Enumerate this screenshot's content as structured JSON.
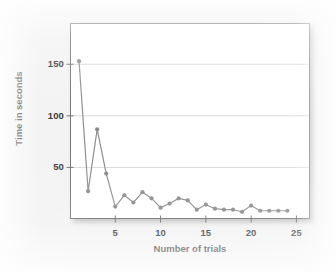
{
  "chart_data": {
    "type": "line",
    "title": "",
    "subtitle": "",
    "xlabel": "Number of trials",
    "ylabel": "Time in seconds",
    "xlim": [
      0,
      26.5
    ],
    "ylim": [
      0,
      190
    ],
    "xticks": [
      5,
      10,
      15,
      20,
      25
    ],
    "yticks": [
      50,
      100,
      150
    ],
    "xtick_labels": [
      "5",
      "10",
      "15",
      "20",
      "25"
    ],
    "ytick_labels": [
      "50",
      "100",
      "150"
    ],
    "grid": "horizontal",
    "legend": "none",
    "marker": "circle",
    "series": [
      {
        "name": "Time per trial",
        "x": [
          1,
          2,
          3,
          4,
          5,
          6,
          7,
          8,
          9,
          10,
          11,
          12,
          13,
          14,
          15,
          16,
          17,
          18,
          19,
          20,
          21,
          22,
          23,
          24
        ],
        "values": [
          153,
          27,
          87,
          44,
          12,
          23,
          16,
          26,
          20,
          11,
          15,
          20,
          18,
          9,
          14,
          10,
          9,
          9,
          7,
          13,
          8,
          8,
          8,
          8
        ]
      }
    ],
    "colors": {
      "line": "#8c8c8c",
      "marker": "#8a8a8a",
      "grid": "#d9d9d9",
      "axis": "#6f6f6f",
      "plot_background": "#ffffff",
      "figure_background": "#f2f2f2",
      "text": "#1a1a1a"
    }
  }
}
